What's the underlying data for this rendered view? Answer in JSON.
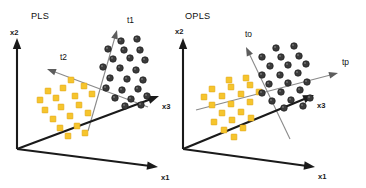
{
  "figure": {
    "width": 366,
    "height": 188,
    "background": "#ffffff"
  },
  "colors": {
    "axis": "#1a1a1a",
    "component_line": "#8a8a8a",
    "dark_class": "#3b3b3b",
    "yellow_class": "#f6c52c",
    "yellow_class_border": "#e0a81c",
    "label_text": "#111111",
    "background": "#ffffff"
  },
  "panels": [
    {
      "id": "pls",
      "title": "PLS",
      "title_pos": {
        "x": 31,
        "y": 17
      },
      "origin": {
        "x": 17,
        "y": 149
      },
      "axes": [
        {
          "name": "x2",
          "label": "x2",
          "label_pos": {
            "x": 10,
            "y": 33
          },
          "from": {
            "x": 17,
            "y": 149
          },
          "to": {
            "x": 17,
            "y": 38
          }
        },
        {
          "name": "x1",
          "label": "x1",
          "label_pos": {
            "x": 161,
            "y": 178
          },
          "from": {
            "x": 17,
            "y": 149
          },
          "to": {
            "x": 158,
            "y": 167
          }
        },
        {
          "name": "x3",
          "label": "x3",
          "label_pos": {
            "x": 162,
            "y": 107
          },
          "from": {
            "x": 17,
            "y": 149
          },
          "to": {
            "x": 159,
            "y": 96
          }
        }
      ],
      "components": [
        {
          "name": "t1",
          "label": "t1",
          "label_pos": {
            "x": 127,
            "y": 21
          },
          "from": {
            "x": 88,
            "y": 131
          },
          "to": {
            "x": 117,
            "y": 30
          }
        },
        {
          "name": "t2",
          "label": "t2",
          "label_pos": {
            "x": 60,
            "y": 58
          },
          "from": {
            "x": 148,
            "y": 107
          },
          "to": {
            "x": 47,
            "y": 69
          }
        }
      ],
      "dark_points": [
        {
          "x": 121,
          "y": 41
        },
        {
          "x": 137,
          "y": 39
        },
        {
          "x": 108,
          "y": 49
        },
        {
          "x": 124,
          "y": 50
        },
        {
          "x": 140,
          "y": 50
        },
        {
          "x": 113,
          "y": 59
        },
        {
          "x": 130,
          "y": 58
        },
        {
          "x": 145,
          "y": 60
        },
        {
          "x": 103,
          "y": 67
        },
        {
          "x": 120,
          "y": 68
        },
        {
          "x": 136,
          "y": 70
        },
        {
          "x": 110,
          "y": 78
        },
        {
          "x": 127,
          "y": 79
        },
        {
          "x": 143,
          "y": 80
        },
        {
          "x": 106,
          "y": 88
        },
        {
          "x": 122,
          "y": 90
        },
        {
          "x": 138,
          "y": 89
        },
        {
          "x": 115,
          "y": 98
        },
        {
          "x": 131,
          "y": 99
        },
        {
          "x": 147,
          "y": 96
        },
        {
          "x": 125,
          "y": 106
        },
        {
          "x": 141,
          "y": 105
        }
      ],
      "yellow_points": [
        {
          "x": 71,
          "y": 80
        },
        {
          "x": 48,
          "y": 91
        },
        {
          "x": 63,
          "y": 88
        },
        {
          "x": 84,
          "y": 86
        },
        {
          "x": 40,
          "y": 100
        },
        {
          "x": 56,
          "y": 98
        },
        {
          "x": 75,
          "y": 96
        },
        {
          "x": 92,
          "y": 94
        },
        {
          "x": 45,
          "y": 110
        },
        {
          "x": 61,
          "y": 107
        },
        {
          "x": 79,
          "y": 105
        },
        {
          "x": 53,
          "y": 119
        },
        {
          "x": 70,
          "y": 116
        },
        {
          "x": 88,
          "y": 113
        },
        {
          "x": 60,
          "y": 128
        },
        {
          "x": 77,
          "y": 126
        },
        {
          "x": 68,
          "y": 136
        },
        {
          "x": 85,
          "y": 133
        }
      ]
    },
    {
      "id": "opls",
      "title": "OPLS",
      "title_pos": {
        "x": 185,
        "y": 17
      },
      "origin": {
        "x": 183,
        "y": 149
      },
      "axes": [
        {
          "name": "x2",
          "label": "x2",
          "label_pos": {
            "x": 175,
            "y": 32
          },
          "from": {
            "x": 183,
            "y": 149
          },
          "to": {
            "x": 183,
            "y": 38
          }
        },
        {
          "name": "x1",
          "label": "x1",
          "label_pos": {
            "x": 318,
            "y": 177
          },
          "from": {
            "x": 183,
            "y": 149
          },
          "to": {
            "x": 315,
            "y": 167
          }
        },
        {
          "name": "x3",
          "label": "x3",
          "label_pos": {
            "x": 317,
            "y": 106
          },
          "from": {
            "x": 183,
            "y": 149
          },
          "to": {
            "x": 314,
            "y": 95
          }
        }
      ],
      "components": [
        {
          "name": "to",
          "label": "to",
          "label_pos": {
            "x": 245,
            "y": 35
          },
          "from": {
            "x": 290,
            "y": 139
          },
          "to": {
            "x": 246,
            "y": 47
          }
        },
        {
          "name": "tp",
          "label": "tp",
          "label_pos": {
            "x": 342,
            "y": 63
          },
          "from": {
            "x": 196,
            "y": 110
          },
          "to": {
            "x": 338,
            "y": 73
          }
        }
      ],
      "dark_points": [
        {
          "x": 276,
          "y": 48
        },
        {
          "x": 294,
          "y": 46
        },
        {
          "x": 262,
          "y": 57
        },
        {
          "x": 281,
          "y": 57
        },
        {
          "x": 299,
          "y": 56
        },
        {
          "x": 270,
          "y": 66
        },
        {
          "x": 288,
          "y": 65
        },
        {
          "x": 306,
          "y": 64
        },
        {
          "x": 262,
          "y": 75
        },
        {
          "x": 280,
          "y": 75
        },
        {
          "x": 298,
          "y": 73
        },
        {
          "x": 269,
          "y": 84
        },
        {
          "x": 288,
          "y": 83
        },
        {
          "x": 307,
          "y": 82
        },
        {
          "x": 262,
          "y": 93
        },
        {
          "x": 281,
          "y": 92
        },
        {
          "x": 300,
          "y": 90
        },
        {
          "x": 272,
          "y": 101
        },
        {
          "x": 291,
          "y": 100
        },
        {
          "x": 310,
          "y": 98
        },
        {
          "x": 284,
          "y": 108
        },
        {
          "x": 303,
          "y": 106
        }
      ],
      "yellow_points": [
        {
          "x": 229,
          "y": 80
        },
        {
          "x": 246,
          "y": 78
        },
        {
          "x": 212,
          "y": 89
        },
        {
          "x": 231,
          "y": 87
        },
        {
          "x": 250,
          "y": 85
        },
        {
          "x": 204,
          "y": 97
        },
        {
          "x": 222,
          "y": 96
        },
        {
          "x": 241,
          "y": 94
        },
        {
          "x": 259,
          "y": 92
        },
        {
          "x": 212,
          "y": 105
        },
        {
          "x": 231,
          "y": 104
        },
        {
          "x": 250,
          "y": 102
        },
        {
          "x": 222,
          "y": 113
        },
        {
          "x": 241,
          "y": 112
        },
        {
          "x": 214,
          "y": 122
        },
        {
          "x": 232,
          "y": 120
        },
        {
          "x": 251,
          "y": 118
        },
        {
          "x": 224,
          "y": 130
        },
        {
          "x": 243,
          "y": 128
        },
        {
          "x": 234,
          "y": 137
        }
      ]
    }
  ]
}
